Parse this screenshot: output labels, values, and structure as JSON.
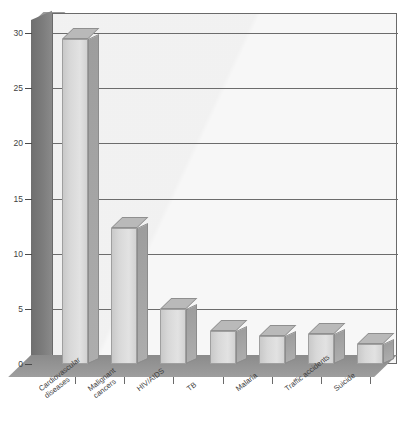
{
  "chart_data": {
    "type": "bar",
    "title": "",
    "xlabel": "",
    "ylabel": "",
    "categories": [
      "Cardiovascular diseases",
      "Malignant cancers",
      "HIV/AIDS",
      "TB",
      "Malaria",
      "Traffic accidents",
      "Suicide"
    ],
    "category_lines": [
      [
        "Cardiovascular",
        "diseases"
      ],
      [
        "Malignant",
        "cancers"
      ],
      [
        "HIV/AIDS"
      ],
      [
        "TB"
      ],
      [
        "Malaria"
      ],
      [
        "Traffic accidents"
      ],
      [
        "Suicide"
      ]
    ],
    "values": [
      29.5,
      12.3,
      5.0,
      3.0,
      2.5,
      2.7,
      1.8
    ],
    "ylim": [
      0,
      30
    ],
    "yticks": [
      0,
      5,
      10,
      15,
      20,
      25,
      30
    ],
    "ytick_labels": [
      "0",
      "5",
      "10",
      "15",
      "20",
      "25",
      "30"
    ],
    "grid": true,
    "legend": false,
    "style": "3d-column"
  },
  "colors": {
    "bar_face": "#d8d8d8",
    "bar_side": "#a3a3a3",
    "bar_top": "#b9b9b9",
    "wall": "#7c7c7c",
    "floor": "#949494",
    "plot_bg": "#f7f7f7",
    "gridline": "#6c6c6c",
    "text": "#3f3f3f"
  },
  "caption": ""
}
